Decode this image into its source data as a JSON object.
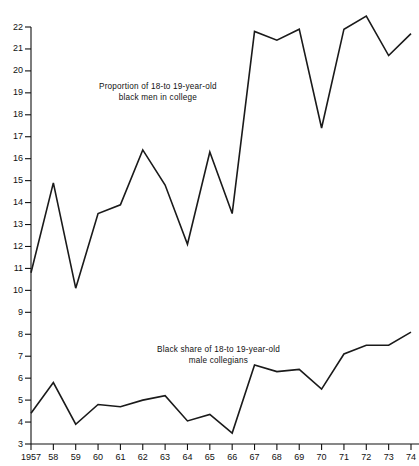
{
  "chart_data": {
    "type": "line",
    "title": "",
    "subtitle": "",
    "xlabel": "",
    "ylabel": "",
    "xlim": [
      1957,
      1974
    ],
    "ylim": [
      3,
      22
    ],
    "grid": false,
    "legend_position": "inline-annotation",
    "x": [
      1957,
      1958,
      1959,
      1960,
      1961,
      1962,
      1963,
      1964,
      1965,
      1966,
      1967,
      1968,
      1969,
      1970,
      1971,
      1972,
      1973,
      1974
    ],
    "x_tick_labels": [
      "1957",
      "58",
      "59",
      "60",
      "61",
      "62",
      "63",
      "64",
      "65",
      "66",
      "67",
      "68",
      "69",
      "70",
      "71",
      "72",
      "73",
      "74"
    ],
    "y_tick_labels": [
      "3",
      "4",
      "5",
      "6",
      "7",
      "8",
      "9",
      "10",
      "11",
      "12",
      "13",
      "14",
      "15",
      "16",
      "17",
      "18",
      "19",
      "20",
      "21",
      "22"
    ],
    "y_ticks": [
      3,
      4,
      5,
      6,
      7,
      8,
      9,
      10,
      11,
      12,
      13,
      14,
      15,
      16,
      17,
      18,
      19,
      20,
      21,
      22
    ],
    "series": [
      {
        "name": "Proportion of 18-to 19-year-old black men in college",
        "annotation": "Proportion of 18-to 19-year-old\nblack men in college",
        "annotation_line1": "Proportion of 18-to 19-year-old",
        "annotation_line2": "black men in college",
        "color": "#1a1a1a",
        "values": [
          10.8,
          14.9,
          10.1,
          13.5,
          13.9,
          16.4,
          14.8,
          12.1,
          16.3,
          13.5,
          21.8,
          21.4,
          21.9,
          17.4,
          21.9,
          22.5,
          20.7,
          21.7
        ]
      },
      {
        "name": "Black share of 18-to 19-year-old male collegians",
        "annotation": "Black share of 18-to 19-year-old\nmale collegians",
        "annotation_line1": "Black share of 18-to 19-year-old",
        "annotation_line2": "male collegians",
        "color": "#1a1a1a",
        "values": [
          4.4,
          5.8,
          3.9,
          4.8,
          4.7,
          5.0,
          5.2,
          4.05,
          4.35,
          3.5,
          6.6,
          6.3,
          6.4,
          5.5,
          7.1,
          7.5,
          7.5,
          8.1
        ]
      }
    ]
  }
}
